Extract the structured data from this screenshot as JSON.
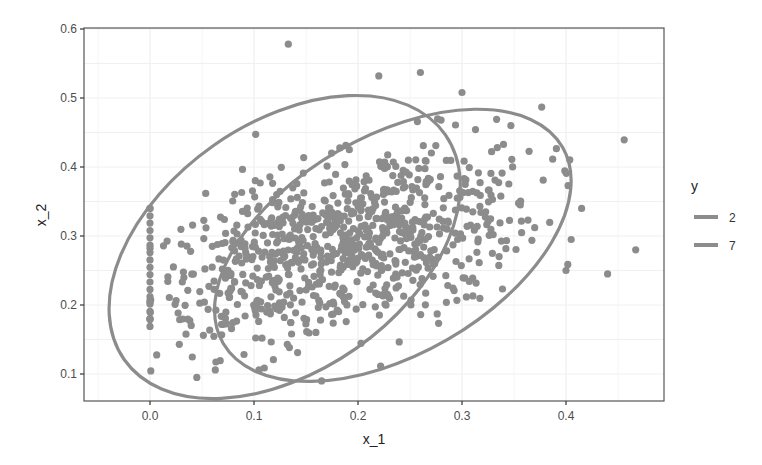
{
  "chart_data": {
    "type": "scatter",
    "title": "",
    "xlabel": "x_1",
    "ylabel": "x_2",
    "xlim": [
      -0.055,
      0.495
    ],
    "ylim": [
      0.063,
      0.601
    ],
    "x_ticks": [
      "0.0",
      "0.1",
      "0.2",
      "0.3",
      "0.4"
    ],
    "x_tick_values": [
      0.0,
      0.1,
      0.2,
      0.3,
      0.4
    ],
    "y_ticks": [
      "0.1",
      "0.2",
      "0.3",
      "0.4",
      "0.5",
      "0.6"
    ],
    "y_tick_values": [
      0.1,
      0.2,
      0.3,
      0.4,
      0.5,
      0.6
    ],
    "grid": true,
    "legend": {
      "title": "y",
      "position": "right",
      "entries": [
        {
          "label": "2",
          "color": "#8c8c8c"
        },
        {
          "label": "7",
          "color": "#8c8c8c"
        }
      ]
    },
    "point_color": "#8c8c8c",
    "point_count_approx": 900,
    "ellipses": [
      {
        "group": "2",
        "center": [
          0.13,
          0.284
        ],
        "x_range": [
          -0.039,
          0.298
        ],
        "y_range": [
          0.083,
          0.485
        ],
        "angle_deg": 35
      },
      {
        "group": "7",
        "center": [
          0.233,
          0.285
        ],
        "x_range": [
          0.062,
          0.405
        ],
        "y_range": [
          0.088,
          0.485
        ],
        "angle_deg": 30
      }
    ],
    "notable_points": [
      {
        "x": 0.133,
        "y": 0.578
      },
      {
        "x": 0.467,
        "y": 0.28
      },
      {
        "x": 0.44,
        "y": 0.245
      },
      {
        "x": 0.4,
        "y": 0.25
      },
      {
        "x": 0.415,
        "y": 0.34
      },
      {
        "x": 0.405,
        "y": 0.295
      },
      {
        "x": 0.26,
        "y": 0.537
      },
      {
        "x": 0.22,
        "y": 0.532
      },
      {
        "x": 0.3,
        "y": 0.508
      },
      {
        "x": 0.0,
        "y": 0.34
      },
      {
        "x": 0.0,
        "y": 0.18
      },
      {
        "x": 0.045,
        "y": 0.095
      },
      {
        "x": 0.165,
        "y": 0.09
      }
    ],
    "clusters": [
      {
        "group": "column-at-zero",
        "x": 0.0,
        "y_range": [
          0.18,
          0.34
        ],
        "count": 16
      },
      {
        "group": "2",
        "mean": [
          0.13,
          0.27
        ],
        "sd": [
          0.065,
          0.065
        ],
        "corr": 0.45,
        "count": 420
      },
      {
        "group": "7",
        "mean": [
          0.235,
          0.3
        ],
        "sd": [
          0.07,
          0.07
        ],
        "corr": 0.4,
        "count": 460
      }
    ]
  }
}
